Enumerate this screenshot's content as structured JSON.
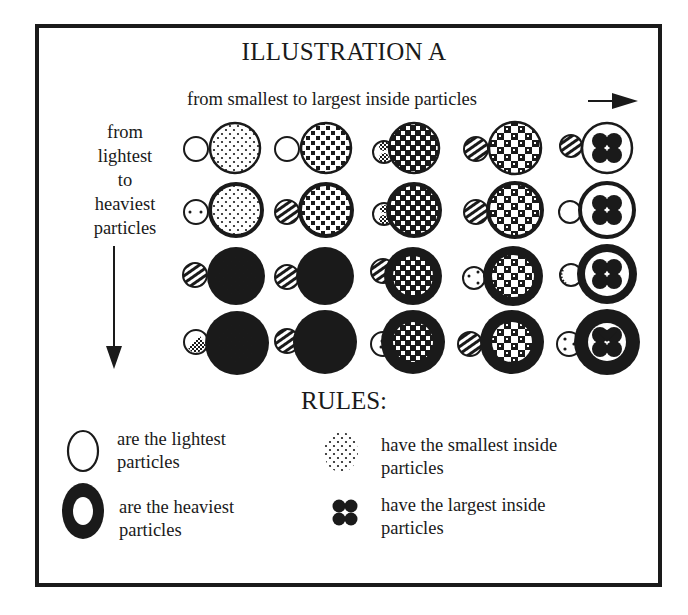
{
  "title": "ILLUSTRATION A",
  "x_axis": {
    "label": "from smallest to largest inside particles",
    "arrow": "right-arrow"
  },
  "y_axis": {
    "label_lines": [
      "from",
      "lightest",
      "to",
      "heaviest",
      "particles"
    ],
    "arrow": "down-arrow"
  },
  "grid": {
    "rows": 4,
    "cols": 5,
    "row_meaning": "weight from lightest (top) to heaviest (bottom)",
    "col_meaning": "inside particle size from smallest (left) to largest (right)",
    "inner_patterns_by_col": [
      "fine-dots",
      "small-squares",
      "medium-checker",
      "large-checker",
      "four-large-dots"
    ],
    "outer_ring_by_row": [
      "thin",
      "medium",
      "thick",
      "heaviest"
    ]
  },
  "rules": {
    "title": "RULES:",
    "items": [
      {
        "icon": "thin-ring-icon",
        "line1": "are the lightest",
        "line2": "particles"
      },
      {
        "icon": "thick-ring-icon",
        "line1": "are the heaviest",
        "line2": "particles"
      },
      {
        "icon": "fine-dots-icon",
        "line1": "have the smallest inside",
        "line2": "particles"
      },
      {
        "icon": "four-dots-icon",
        "line1": "have the largest inside",
        "line2": "particles"
      }
    ]
  },
  "colors": {
    "ink": "#1a1a1a",
    "paper": "#ffffff"
  }
}
